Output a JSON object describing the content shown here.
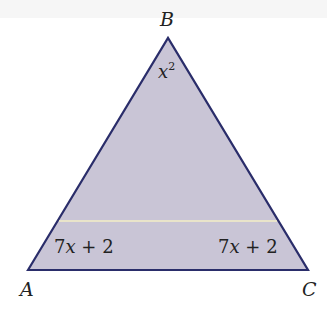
{
  "diagram": {
    "type": "triangle",
    "fill_color": "#c9c5d6",
    "stroke_color": "#2a2d6a",
    "midline_color": "#f3eec6",
    "vertices": [
      {
        "name": "A",
        "label": "A"
      },
      {
        "name": "B",
        "label": "B"
      },
      {
        "name": "C",
        "label": "C"
      }
    ],
    "angles": {
      "B": {
        "base": "x",
        "exp": "2"
      },
      "A": {
        "coef": "7",
        "var": "x",
        "rest": " + 2"
      },
      "C": {
        "coef": "7",
        "var": "x",
        "rest": " + 2"
      }
    }
  }
}
